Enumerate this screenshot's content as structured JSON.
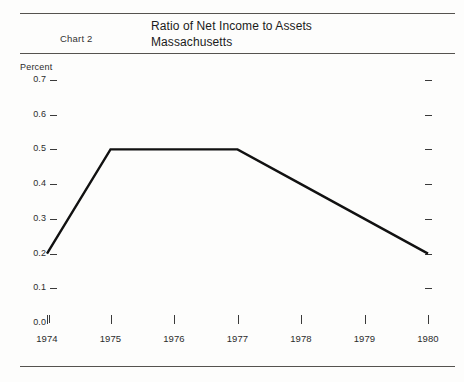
{
  "header": {
    "chart_number": "Chart 2",
    "title_line1": "Ratio of Net Income to Assets",
    "title_line2": "Massachusetts"
  },
  "axis": {
    "unit_label": "Percent",
    "y_ticks": [
      "0.7",
      "0.6",
      "0.5",
      "0.4",
      "0.3",
      "0.2",
      "0.1",
      "0.0"
    ],
    "x_ticks": [
      "1974",
      "1975",
      "1976",
      "1977",
      "1978",
      "1979",
      "1980"
    ]
  },
  "style": {
    "line_color": "#111111",
    "rule_color": "#55534f",
    "text_color": "#2c2c2c",
    "background": "#fdfdfc"
  },
  "chart_data": {
    "type": "line",
    "title": "Ratio of Net Income to Assets",
    "subtitle": "Massachusetts",
    "xlabel": "",
    "ylabel": "Percent",
    "x": [
      "1974",
      "1975",
      "1976",
      "1977",
      "1978",
      "1979",
      "1980"
    ],
    "values": [
      0.2,
      0.5,
      0.5,
      0.5,
      0.4,
      0.3,
      0.2
    ],
    "ylim": [
      0.0,
      0.7
    ],
    "ytick_step": 0.1,
    "grid": false,
    "legend": "none",
    "series": [
      {
        "name": "Ratio of Net Income to Assets",
        "values": [
          0.2,
          0.5,
          0.5,
          0.5,
          0.4,
          0.3,
          0.2
        ]
      }
    ]
  }
}
